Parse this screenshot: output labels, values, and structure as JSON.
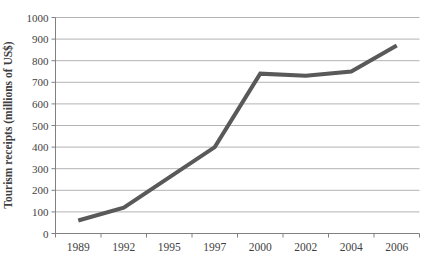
{
  "chart_data": {
    "type": "line",
    "title": "",
    "xlabel": "",
    "ylabel": "Tourism receipts (millions of US$)",
    "categories": [
      "1989",
      "1992",
      "1995",
      "1997",
      "2000",
      "2002",
      "2004",
      "2006"
    ],
    "values": [
      60,
      120,
      260,
      400,
      740,
      730,
      750,
      870
    ],
    "ylim": [
      0,
      1000
    ],
    "ytick_step": 100,
    "yticks": [
      0,
      100,
      200,
      300,
      400,
      500,
      600,
      700,
      800,
      900,
      1000
    ],
    "grid": "horizontal",
    "legend": "none",
    "colors": {
      "line": "#595959",
      "gridline": "#b3b3b3",
      "axis": "#808080",
      "tick": "#808080",
      "text": "#3f3f3f",
      "background": "#ffffff"
    }
  }
}
